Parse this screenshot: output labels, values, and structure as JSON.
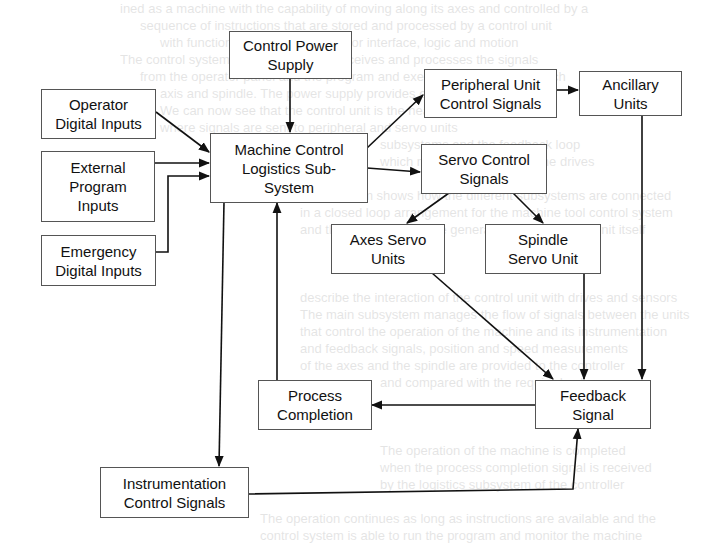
{
  "diagram": {
    "type": "block-diagram",
    "nodes": {
      "control_power_supply": {
        "label": "Control Power Supply"
      },
      "operator_digital_inputs": {
        "label": "Operator Digital Inputs"
      },
      "external_program_inputs": {
        "label": "External Program Inputs"
      },
      "emergency_digital_inputs": {
        "label": "Emergency Digital Inputs"
      },
      "machine_control": {
        "label": "Machine Control Logistics Sub-System"
      },
      "peripheral_unit": {
        "label": "Peripheral Unit Control Signals"
      },
      "ancillary_units": {
        "label": "Ancillary Units"
      },
      "servo_control": {
        "label": "Servo Control Signals"
      },
      "axes_servo": {
        "label": "Axes Servo Units"
      },
      "spindle_servo": {
        "label": "Spindle Servo Unit"
      },
      "process_completion": {
        "label": "Process Completion"
      },
      "feedback_signal": {
        "label": "Feedback Signal"
      },
      "instrumentation": {
        "label": "Instrumentation Control Signals"
      }
    },
    "edges": [
      {
        "from": "Control Power Supply",
        "to": "Machine Control Logistics Sub-System"
      },
      {
        "from": "Operator Digital Inputs",
        "to": "Machine Control Logistics Sub-System"
      },
      {
        "from": "External Program Inputs",
        "to": "Machine Control Logistics Sub-System"
      },
      {
        "from": "Emergency Digital Inputs",
        "to": "Machine Control Logistics Sub-System"
      },
      {
        "from": "Machine Control Logistics Sub-System",
        "to": "Peripheral Unit Control Signals"
      },
      {
        "from": "Machine Control Logistics Sub-System",
        "to": "Servo Control Signals"
      },
      {
        "from": "Machine Control Logistics Sub-System",
        "to": "Instrumentation Control Signals"
      },
      {
        "from": "Peripheral Unit Control Signals",
        "to": "Ancillary Units"
      },
      {
        "from": "Servo Control Signals",
        "to": "Axes Servo Units"
      },
      {
        "from": "Servo Control Signals",
        "to": "Spindle Servo Unit"
      },
      {
        "from": "Ancillary Units",
        "to": "Feedback Signal"
      },
      {
        "from": "Axes Servo Units",
        "to": "Feedback Signal"
      },
      {
        "from": "Spindle Servo Unit",
        "to": "Feedback Signal"
      },
      {
        "from": "Instrumentation Control Signals",
        "to": "Feedback Signal"
      },
      {
        "from": "Feedback Signal",
        "to": "Process Completion"
      },
      {
        "from": "Process Completion",
        "to": "Machine Control Logistics Sub-System"
      }
    ]
  },
  "labels": {
    "cps_l1": "Control Power",
    "cps_l2": "Supply",
    "odi_l1": "Operator",
    "odi_l2": "Digital Inputs",
    "epi_l1": "External",
    "epi_l2": "Program",
    "epi_l3": "Inputs",
    "edi_l1": "Emergency",
    "edi_l2": "Digital Inputs",
    "mc_l1": "Machine Control",
    "mc_l2": "Logistics Sub-",
    "mc_l3": "System",
    "pu_l1": "Peripheral Unit",
    "pu_l2": "Control Signals",
    "au_l1": "Ancillary",
    "au_l2": "Units",
    "sc_l1": "Servo Control",
    "sc_l2": "Signals",
    "as_l1": "Axes Servo",
    "as_l2": "Units",
    "ss_l1": "Spindle",
    "ss_l2": "Servo Unit",
    "pc_l1": "Process",
    "pc_l2": "Completion",
    "fb_l1": "Feedback",
    "fb_l2": "Signal",
    "ic_l1": "Instrumentation",
    "ic_l2": "Control Signals"
  }
}
